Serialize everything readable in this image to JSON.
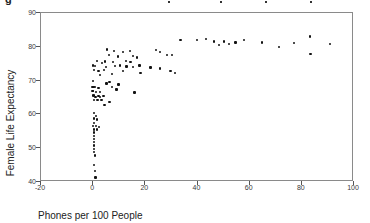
{
  "title_fragments": {
    "glyph": "g",
    "dot_xs": [
      168,
      220,
      265,
      310
    ]
  },
  "colors": {
    "background": "#ffffff",
    "frame": "#8a8a8a",
    "marker": "#121212",
    "tick_text": "#3a3a3a",
    "axis_label_text": "#222222"
  },
  "chart_data": {
    "type": "scatter",
    "title": "",
    "xlabel": "Phones per 100 People",
    "ylabel": "Female Life Expectancy",
    "xlim": [
      -20,
      100
    ],
    "ylim": [
      40,
      90
    ],
    "x_ticks": [
      -20,
      0,
      20,
      40,
      60,
      80,
      100
    ],
    "y_ticks": [
      90,
      80,
      70,
      60,
      50,
      40
    ],
    "grid": false,
    "legend": "none",
    "marker_style": "small black square",
    "points": [
      [
        0.8,
        60.1
      ],
      [
        1.4,
        59.3
      ],
      [
        0.6,
        58.5
      ],
      [
        1.8,
        58.2
      ],
      [
        0.8,
        57.2
      ],
      [
        0.2,
        56.2
      ],
      [
        1.4,
        56.2
      ],
      [
        2.7,
        56.0
      ],
      [
        0.6,
        55.2
      ],
      [
        1.8,
        55.2
      ],
      [
        0.8,
        54.4
      ],
      [
        0.6,
        53.4
      ],
      [
        0.8,
        52.4
      ],
      [
        0.6,
        51.5
      ],
      [
        0.8,
        50.5
      ],
      [
        0.6,
        49.5
      ],
      [
        0.8,
        48.5
      ],
      [
        1.1,
        47.5
      ],
      [
        0.8,
        44.8
      ],
      [
        1.1,
        43.0
      ],
      [
        1.3,
        41.0
      ],
      [
        1.3,
        64.8
      ],
      [
        2.9,
        64.8
      ],
      [
        4.4,
        65.1
      ],
      [
        0.8,
        63.9
      ],
      [
        2.1,
        63.9
      ],
      [
        3.6,
        63.9
      ],
      [
        6.6,
        63.3
      ],
      [
        4.8,
        62.4
      ],
      [
        0.2,
        65.3
      ],
      [
        0.8,
        65.3
      ],
      [
        2.4,
        65.1
      ],
      [
        0.1,
        66.6
      ],
      [
        0.4,
        66.6
      ],
      [
        1.5,
        66.3
      ],
      [
        3.0,
        66.3
      ],
      [
        0.1,
        67.9
      ],
      [
        0.5,
        67.9
      ],
      [
        1.0,
        67.9
      ],
      [
        2.4,
        67.6
      ],
      [
        7.5,
        67.9
      ],
      [
        0.3,
        69.6
      ],
      [
        6.6,
        69.3
      ],
      [
        5.5,
        68.9
      ],
      [
        10.1,
        68.6
      ],
      [
        9.3,
        67.1
      ],
      [
        16.2,
        66.2
      ],
      [
        3.0,
        71.3
      ],
      [
        7.5,
        71.6
      ],
      [
        0.8,
        72.8
      ],
      [
        2.4,
        72.5
      ],
      [
        4.6,
        72.8
      ],
      [
        11.9,
        72.5
      ],
      [
        0.2,
        74.2
      ],
      [
        1.1,
        74.0
      ],
      [
        5.3,
        73.8
      ],
      [
        8.8,
        74.0
      ],
      [
        10.7,
        74.2
      ],
      [
        15.7,
        73.8
      ],
      [
        13.2,
        73.9
      ],
      [
        1.8,
        75.5
      ],
      [
        3.8,
        75.0
      ],
      [
        5.0,
        75.4
      ],
      [
        8.0,
        75.2
      ],
      [
        13.0,
        75.5
      ],
      [
        14.7,
        75.2
      ],
      [
        6.5,
        77.2
      ],
      [
        9.9,
        76.8
      ],
      [
        15.6,
        77.0
      ],
      [
        17.1,
        76.5
      ],
      [
        5.7,
        78.9
      ],
      [
        8.4,
        78.5
      ],
      [
        11.8,
        78.2
      ],
      [
        14.5,
        78.5
      ],
      [
        24.4,
        78.7
      ],
      [
        25.9,
        78.1
      ],
      [
        28.6,
        77.2
      ],
      [
        30.5,
        77.2
      ],
      [
        18.1,
        74.2
      ],
      [
        22.4,
        73.6
      ],
      [
        26.1,
        73.3
      ],
      [
        30.1,
        72.5
      ],
      [
        31.8,
        71.9
      ],
      [
        18.5,
        71.9
      ],
      [
        33.8,
        81.7
      ],
      [
        40.2,
        81.8
      ],
      [
        43.6,
        82.0
      ],
      [
        46.7,
        81.3
      ],
      [
        48.6,
        80.3
      ],
      [
        50.5,
        81.3
      ],
      [
        52.4,
        80.6
      ],
      [
        55.0,
        81.0
      ],
      [
        58.1,
        81.7
      ],
      [
        65.0,
        81.0
      ],
      [
        71.7,
        79.7
      ],
      [
        77.4,
        80.8
      ],
      [
        83.4,
        82.8
      ],
      [
        83.7,
        77.5
      ],
      [
        91.2,
        80.5
      ]
    ]
  }
}
